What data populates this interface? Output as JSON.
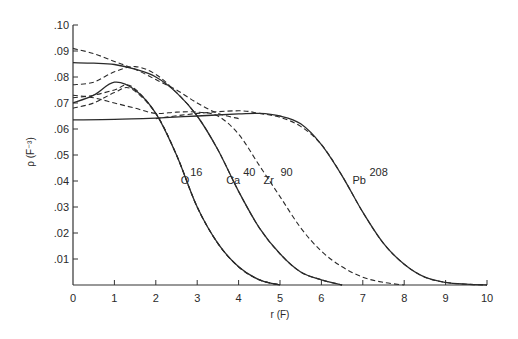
{
  "chart_data": {
    "type": "line",
    "title": "",
    "xlabel": "r (F)",
    "ylabel": "ρ (F⁻³)",
    "xlim": [
      0,
      10
    ],
    "ylim": [
      0,
      0.1
    ],
    "grid": false,
    "legend": "none (inline curve labels)",
    "x_ticks": [
      "0",
      "1",
      "2",
      "3",
      "4",
      "5",
      "6",
      "7",
      "8",
      "9",
      "10"
    ],
    "y_ticks": [
      "0",
      ".01",
      ".02",
      ".03",
      ".04",
      ".05",
      ".06",
      ".07",
      ".08",
      ".09",
      ".10"
    ],
    "annotations": [
      {
        "text": "O",
        "sup": "16",
        "x": 2.6,
        "y": 0.039
      },
      {
        "text": "Ca",
        "sup": "40",
        "x": 3.7,
        "y": 0.039
      },
      {
        "text": "Zr",
        "sup": "90",
        "x": 4.6,
        "y": 0.039
      },
      {
        "text": "Pb",
        "sup": "208",
        "x": 6.75,
        "y": 0.039
      }
    ],
    "series": [
      {
        "name": "O16 (solid)",
        "style": "solid",
        "x": [
          0,
          0.5,
          1.0,
          1.5,
          2.0,
          2.5,
          3.0,
          3.5,
          4.0,
          4.5,
          5.0
        ],
        "y": [
          0.07,
          0.073,
          0.078,
          0.075,
          0.066,
          0.05,
          0.03,
          0.016,
          0.007,
          0.002,
          0.0
        ]
      },
      {
        "name": "O16 (dashed, upper)",
        "style": "dashed",
        "x": [
          0,
          0.5,
          1.0,
          1.4,
          2.0,
          2.5,
          3.0,
          3.5,
          4.0,
          4.5,
          5.0
        ],
        "y": [
          0.072,
          0.073,
          0.075,
          0.0765,
          0.066,
          0.05,
          0.03,
          0.016,
          0.007,
          0.002,
          0.0
        ]
      },
      {
        "name": "O16 (dashed, lower)",
        "style": "dashed",
        "x": [
          0,
          0.5,
          1.0,
          1.4,
          2.0,
          2.5,
          3.0,
          3.5,
          4.0,
          4.5,
          5.0
        ],
        "y": [
          0.068,
          0.07,
          0.074,
          0.0755,
          0.066,
          0.05,
          0.03,
          0.016,
          0.007,
          0.002,
          0.0
        ]
      },
      {
        "name": "Ca40 (solid)",
        "style": "solid",
        "x": [
          0,
          0.5,
          1.0,
          1.5,
          2.0,
          2.5,
          3.0,
          3.5,
          4.0,
          4.5,
          5.0,
          5.5,
          6.0,
          6.5
        ],
        "y": [
          0.0855,
          0.0853,
          0.0848,
          0.083,
          0.08,
          0.074,
          0.065,
          0.052,
          0.036,
          0.022,
          0.012,
          0.005,
          0.002,
          0.0
        ]
      },
      {
        "name": "Ca40 (dashed)",
        "style": "dashed",
        "x": [
          0,
          0.5,
          1.0,
          1.5,
          2.0,
          2.5,
          3.0,
          3.5,
          4.0,
          4.5,
          5.0,
          5.5,
          6.0,
          6.5
        ],
        "y": [
          0.077,
          0.078,
          0.082,
          0.084,
          0.081,
          0.074,
          0.065,
          0.052,
          0.036,
          0.022,
          0.012,
          0.005,
          0.002,
          0.0
        ]
      },
      {
        "name": "Ca40 (dashed, high start)",
        "style": "dashed",
        "x": [
          0,
          0.5,
          1.0,
          1.5,
          2.0,
          2.5,
          3.0,
          3.5,
          4.0
        ],
        "y": [
          0.091,
          0.089,
          0.086,
          0.083,
          0.079,
          0.075,
          0.07,
          0.066,
          0.064
        ]
      },
      {
        "name": "Zr90 (dashed)",
        "style": "dashed",
        "x": [
          0,
          0.5,
          1.0,
          1.5,
          2.0,
          2.5,
          3.0,
          3.5,
          4.0,
          4.5,
          5.0,
          5.5,
          6.0,
          6.5,
          7.0,
          7.5,
          8.0
        ],
        "y": [
          0.073,
          0.072,
          0.07,
          0.068,
          0.066,
          0.0665,
          0.0665,
          0.065,
          0.058,
          0.046,
          0.034,
          0.022,
          0.013,
          0.007,
          0.003,
          0.001,
          0.0
        ]
      },
      {
        "name": "Pb208 (solid)",
        "style": "solid",
        "x": [
          0,
          1,
          2,
          3,
          4,
          4.5,
          5,
          5.5,
          6,
          6.5,
          7,
          7.5,
          8,
          8.5,
          9,
          9.5,
          10
        ],
        "y": [
          0.0635,
          0.0637,
          0.0642,
          0.065,
          0.0658,
          0.066,
          0.065,
          0.062,
          0.054,
          0.042,
          0.028,
          0.016,
          0.008,
          0.003,
          0.001,
          0.0003,
          0.0
        ]
      },
      {
        "name": "Pb208 (dashed)",
        "style": "dashed",
        "x": [
          2,
          3,
          4,
          4.5,
          5,
          5.5,
          6,
          6.5,
          7,
          7.5,
          8,
          8.5,
          9,
          9.5,
          10
        ],
        "y": [
          0.064,
          0.066,
          0.067,
          0.066,
          0.0645,
          0.061,
          0.054,
          0.042,
          0.028,
          0.016,
          0.008,
          0.003,
          0.001,
          0.0003,
          0.0
        ]
      }
    ]
  }
}
